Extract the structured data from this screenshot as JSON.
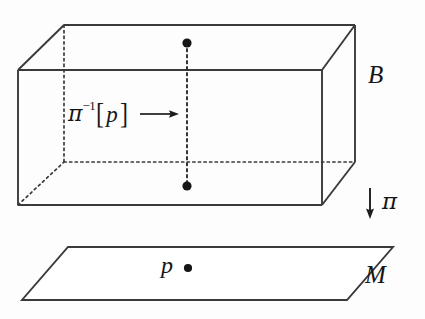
{
  "figure": {
    "kind": "fiber-bundle-diagram",
    "background_color": "#fdfdfd",
    "line_color": "#3a3a3a",
    "text_color": "#161616"
  },
  "labels": {
    "total_space": "B",
    "base_space": "M",
    "projection_map": "π",
    "base_point": "p",
    "fiber_pi": "π",
    "fiber_exponent": "−1",
    "fiber_bracket_open": "[",
    "fiber_bracket_close": "]",
    "fiber_arg": "p",
    "fiber_full": "π⁻¹[p]"
  },
  "geometry": {
    "total_space_box": {
      "front_face": [
        [
          18,
          70
        ],
        [
          322,
          70
        ],
        [
          322,
          205
        ],
        [
          18,
          205
        ]
      ],
      "back_face": [
        [
          64,
          25
        ],
        [
          355,
          25
        ],
        [
          355,
          162
        ],
        [
          64,
          162
        ]
      ],
      "visible_edges": [
        [
          [
            18,
            70
          ],
          [
            322,
            70
          ]
        ],
        [
          [
            18,
            70
          ],
          [
            18,
            205
          ]
        ],
        [
          [
            322,
            70
          ],
          [
            322,
            205
          ]
        ],
        [
          [
            18,
            205
          ],
          [
            322,
            205
          ]
        ],
        [
          [
            64,
            25
          ],
          [
            355,
            25
          ]
        ],
        [
          [
            18,
            70
          ],
          [
            64,
            25
          ]
        ],
        [
          [
            322,
            70
          ],
          [
            355,
            25
          ]
        ],
        [
          [
            355,
            25
          ],
          [
            355,
            162
          ]
        ],
        [
          [
            322,
            205
          ],
          [
            355,
            162
          ]
        ]
      ],
      "hidden_edges": [
        [
          [
            64,
            25
          ],
          [
            64,
            162
          ]
        ],
        [
          [
            64,
            162
          ],
          [
            355,
            162
          ]
        ],
        [
          [
            18,
            205
          ],
          [
            64,
            162
          ]
        ]
      ]
    },
    "fiber_line": {
      "x": 187,
      "y_top": 43,
      "y_bottom": 186,
      "style": "dashed",
      "endpoint_dots": [
        [
          187,
          43
        ],
        [
          187,
          186
        ]
      ],
      "dot_radius": 4.5
    },
    "projection_arrow": {
      "x": 370,
      "y_start": 188,
      "y_end": 218
    },
    "fiber_label_arrow": {
      "x_start": 140,
      "x_end": 174,
      "y": 114
    },
    "base_manifold": {
      "corners": [
        [
          68,
          247
        ],
        [
          393,
          247
        ],
        [
          347,
          300
        ],
        [
          22,
          300
        ]
      ]
    },
    "base_point_dot": {
      "x": 188,
      "y": 268,
      "radius": 4
    }
  }
}
